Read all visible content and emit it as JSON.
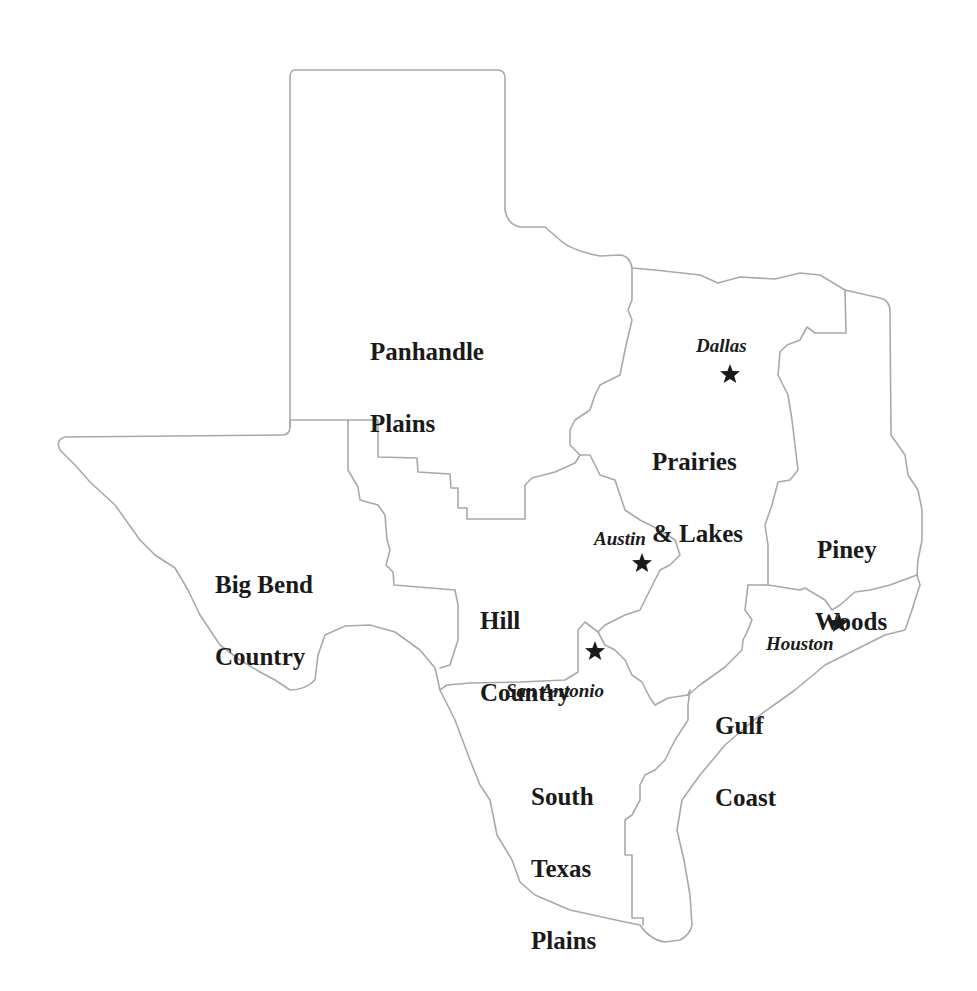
{
  "map": {
    "title": "Texas travel regions",
    "colors": {
      "border": "#a9a9a9",
      "label": "#1a1a1a",
      "star": "#1a1a1a",
      "background": "#ffffff"
    },
    "regions": [
      {
        "id": "panhandle-plains",
        "name": "Panhandle\nPlains",
        "line1": "Panhandle",
        "line2": "Plains"
      },
      {
        "id": "prairies-lakes",
        "name": "Prairies\n& Lakes",
        "line1": "Prairies",
        "line2": "& Lakes"
      },
      {
        "id": "piney-woods",
        "name": "Piney\nWoods",
        "line1": "Piney",
        "line2": "Woods"
      },
      {
        "id": "big-bend-country",
        "name": "Big Bend\nCountry",
        "line1": "Big Bend",
        "line2": "Country"
      },
      {
        "id": "hill-country",
        "name": "Hill\nCountry",
        "line1": "Hill",
        "line2": "Country"
      },
      {
        "id": "gulf-coast",
        "name": "Gulf\nCoast",
        "line1": "Gulf",
        "line2": "Coast"
      },
      {
        "id": "south-texas-plains",
        "name": "South\nTexas\nPlains",
        "line1": "South",
        "line2": "Texas",
        "line3": "Plains"
      }
    ],
    "cities": [
      {
        "id": "dallas",
        "name": "Dallas",
        "icon": "star-icon"
      },
      {
        "id": "austin",
        "name": "Austin",
        "icon": "star-icon"
      },
      {
        "id": "houston",
        "name": "Houston",
        "icon": "star-icon"
      },
      {
        "id": "san-antonio",
        "name": "San Antonio",
        "icon": "star-icon"
      }
    ]
  }
}
